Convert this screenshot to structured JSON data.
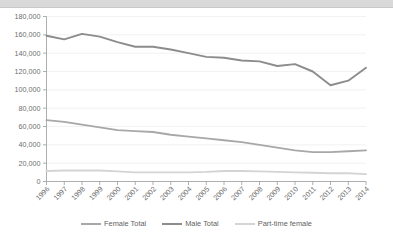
{
  "chart_data": {
    "type": "line",
    "title": "",
    "subtitle": "",
    "xlabel": "",
    "ylabel": "",
    "categories": [
      "1996",
      "1997",
      "1998",
      "1999",
      "2000",
      "2001",
      "2002",
      "2003",
      "2004",
      "2005",
      "2006",
      "2007",
      "2008",
      "2009",
      "2010",
      "2011",
      "2012",
      "2013",
      "2014"
    ],
    "series": [
      {
        "name": "Female Total",
        "color": "#a8a8a8",
        "values": [
          67000,
          65000,
          62000,
          59000,
          56000,
          55000,
          54000,
          51000,
          49000,
          47000,
          45000,
          43000,
          40000,
          37000,
          34000,
          32000,
          32000,
          33000,
          34000
        ]
      },
      {
        "name": "Male Total",
        "color": "#8c8c8c",
        "values": [
          159000,
          155000,
          161000,
          158000,
          152000,
          147000,
          147000,
          144000,
          140000,
          136000,
          135000,
          132000,
          131000,
          126000,
          128000,
          120000,
          105000,
          110000,
          124000
        ]
      },
      {
        "name": "Part-time female",
        "color": "#d4d4d4",
        "values": [
          11500,
          12000,
          12000,
          12000,
          11000,
          10000,
          10000,
          10000,
          10000,
          10500,
          11500,
          11500,
          11000,
          10500,
          10000,
          9500,
          9000,
          9000,
          8000
        ]
      }
    ],
    "ylim": [
      0,
      180000
    ],
    "ytick_step": 20000,
    "ytick_labels": [
      "0",
      "20,000",
      "40,000",
      "60,000",
      "80,000",
      "100,000",
      "120,000",
      "140,000",
      "160,000",
      "180,000"
    ],
    "grid": true,
    "grid_axis": "y",
    "legend_position": "bottom"
  },
  "legend": {
    "items": [
      {
        "label": "Female Total"
      },
      {
        "label": "Male Total"
      },
      {
        "label": "Part-time female"
      }
    ]
  }
}
